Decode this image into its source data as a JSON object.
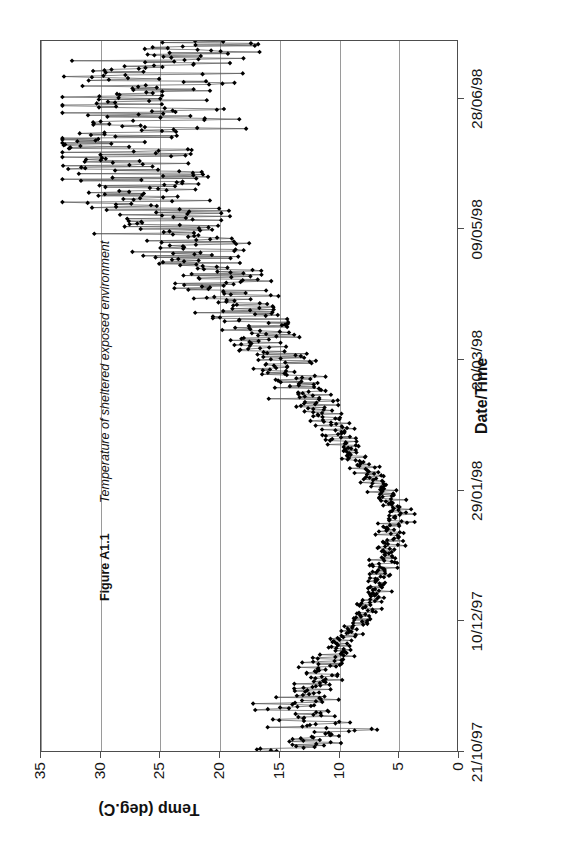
{
  "figure": {
    "caption_number": "Figure A1.1",
    "caption_text": "Temperature of sheltered exposed environment"
  },
  "chart_data": {
    "type": "line",
    "title": "",
    "xlabel": "Date/Time",
    "ylabel": "Temp (deg.C)",
    "ylim": [
      0,
      35
    ],
    "yticks": [
      0,
      5,
      10,
      15,
      20,
      25,
      30,
      35
    ],
    "ytick_labels": [
      "0",
      "5",
      "10",
      "15",
      "20",
      "25",
      "30",
      "35"
    ],
    "xtick_labels": [
      "21/10/97",
      "10/12/97",
      "29/01/98",
      "20/03/98",
      "09/05/98",
      "28/06/98"
    ],
    "xtick_positions": [
      0,
      0.1835,
      0.367,
      0.5505,
      0.734,
      0.9175
    ],
    "xlim_labels": [
      "21/10/97",
      "28/06/98"
    ],
    "grid": "horizontal",
    "legend": "none",
    "marker": "diamond",
    "marker_color": "#000000",
    "line_color": "#555555",
    "series": [
      {
        "name": "Temp (deg.C)",
        "values": [
          15.0,
          14.6,
          14.8,
          12.1,
          12.5,
          10.9,
          12.2,
          13.3,
          11.9,
          11.6,
          10.4,
          10.5,
          10.7,
          8.4,
          7.3,
          13.5,
          11.2,
          12.8,
          10.1,
          12.3,
          13.6,
          14.0,
          11.4,
          11.0,
          13.1,
          9.8,
          14.7,
          12.6,
          13.4,
          10.6,
          14.9,
          12.0,
          11.3,
          10.2,
          13.0,
          12.4,
          11.7,
          10.8,
          12.9,
          11.5,
          12.2,
          10.9,
          11.1,
          12.7,
          11.8,
          10.3,
          12.1,
          11.0,
          10.6,
          11.4,
          10.9,
          11.2,
          10.5,
          11.6,
          10.1,
          10.7,
          11.3,
          10.4,
          10.8,
          11.0,
          9.6,
          10.2,
          9.9,
          10.5,
          9.4,
          10.0,
          9.7,
          10.3,
          9.2,
          9.8,
          8.9,
          9.5,
          8.6,
          9.1,
          8.3,
          8.8,
          9.3,
          8.5,
          9.0,
          8.2,
          7.8,
          8.4,
          7.5,
          8.1,
          7.9,
          8.6,
          7.6,
          8.3,
          7.2,
          7.9,
          6.9,
          7.6,
          7.3,
          8.0,
          6.6,
          7.2,
          7.7,
          6.8,
          7.4,
          6.5,
          7.1,
          6.2,
          6.8,
          7.5,
          6.4,
          7.0,
          6.1,
          6.7,
          7.3,
          6.3,
          6.9,
          5.9,
          6.5,
          7.1,
          6.0,
          6.6,
          5.7,
          6.2,
          6.8,
          5.5,
          6.1,
          6.7,
          5.3,
          5.9,
          6.4,
          5.1,
          5.7,
          6.3,
          5.4,
          6.0,
          4.9,
          5.6,
          6.2,
          5.2,
          5.8,
          4.7,
          5.4,
          6.0,
          5.0,
          5.6,
          4.5,
          5.2,
          5.9,
          4.8,
          5.5,
          4.3,
          5.0,
          5.7,
          4.6,
          5.3,
          4.1,
          4.8,
          5.5,
          4.4,
          5.1,
          5.8,
          4.7,
          5.4,
          6.1,
          5.0,
          5.7,
          6.4,
          5.3,
          6.0,
          6.7,
          5.6,
          6.3,
          7.0,
          5.9,
          6.6,
          7.3,
          6.2,
          6.9,
          7.6,
          6.5,
          7.2,
          7.9,
          6.8,
          7.5,
          8.2,
          7.1,
          7.8,
          8.5,
          7.4,
          8.1,
          8.8,
          7.7,
          8.4,
          9.1,
          8.0,
          8.7,
          9.4,
          8.3,
          9.0,
          9.7,
          8.6,
          9.3,
          10.0,
          8.9,
          9.6,
          10.3,
          9.2,
          9.9,
          10.6,
          9.5,
          10.2,
          10.9,
          9.8,
          10.5,
          11.2,
          10.1,
          10.8,
          11.5,
          10.4,
          11.1,
          11.8,
          10.7,
          11.4,
          12.1,
          11.0,
          11.7,
          12.4,
          11.3,
          12.0,
          12.7,
          11.6,
          12.3,
          13.0,
          11.9,
          12.6,
          13.3,
          12.2,
          12.9,
          13.6,
          12.5,
          13.2,
          13.9,
          12.8,
          13.5,
          14.2,
          13.1,
          13.8,
          14.5,
          13.4,
          14.1,
          14.8,
          13.7,
          14.4,
          15.1,
          14.0,
          14.7,
          15.4,
          14.3,
          15.0,
          15.7,
          14.6,
          15.3,
          16.0,
          14.9,
          15.6,
          16.3,
          15.2,
          15.9,
          16.6,
          15.5,
          16.2,
          16.9,
          15.8,
          16.5,
          17.2,
          16.1,
          16.8,
          17.5,
          16.4,
          17.1,
          17.8,
          16.7,
          17.4,
          18.1,
          17.0,
          17.7,
          18.4,
          17.3,
          18.0,
          18.7,
          17.6,
          18.3,
          19.0,
          17.9,
          18.6,
          19.3,
          18.2,
          18.9,
          19.6,
          18.5,
          19.2,
          19.9,
          18.8,
          19.5,
          20.2,
          19.1,
          19.8,
          20.5,
          19.4,
          20.1,
          20.8,
          19.7,
          20.4,
          21.1,
          20.0,
          20.7,
          21.4,
          20.3,
          21.0,
          21.7,
          20.6,
          21.3,
          22.0,
          20.9,
          21.6,
          22.3,
          21.2,
          21.9,
          22.6,
          21.5,
          22.2,
          22.9,
          21.8,
          22.5,
          23.2,
          22.1,
          22.8,
          23.5,
          22.4,
          23.1,
          23.8,
          22.7,
          23.4,
          24.1,
          23.0,
          23.7,
          24.4,
          23.3,
          24.0,
          24.7,
          23.6,
          24.3,
          25.0,
          23.9,
          24.6,
          25.3,
          24.2,
          24.9,
          25.6,
          24.5,
          25.2,
          25.9,
          24.8,
          25.5,
          26.2,
          25.1,
          25.8,
          26.5,
          25.4,
          26.1,
          26.8,
          25.7,
          26.4,
          27.1,
          26.0,
          26.7,
          27.4,
          26.3,
          27.0,
          27.7,
          26.6,
          27.3,
          28.0,
          26.9,
          27.6,
          28.3,
          27.2,
          27.9,
          28.6,
          27.5,
          28.2,
          28.9,
          27.8,
          28.5,
          29.2,
          28.1,
          28.8,
          26.5,
          24.2,
          22.0,
          25.1,
          27.3,
          29.5,
          26.8,
          24.5,
          22.3,
          25.4,
          27.6,
          30.1,
          27.0,
          24.8,
          22.6,
          25.7,
          27.9,
          30.4,
          27.2,
          25.0,
          22.8,
          25.9,
          28.1,
          31.0,
          27.5,
          25.3,
          23.1,
          26.2,
          28.4,
          26.0,
          23.8,
          21.5,
          24.6,
          26.9,
          29.1,
          26.4,
          24.1,
          21.9,
          25.0,
          27.2,
          29.4,
          26.7,
          24.4,
          22.2,
          25.3,
          27.5,
          22.4,
          20.1,
          23.2,
          25.4,
          21.0,
          18.7,
          21.8,
          24.0,
          20.6,
          18.3,
          21.4,
          23.6
        ]
      }
    ]
  }
}
